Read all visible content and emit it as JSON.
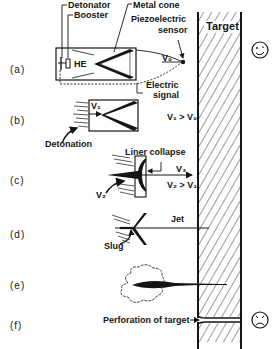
{
  "figure": {
    "colors": {
      "ink": "#151515",
      "background": "#ffffff"
    },
    "target_label": "Target",
    "stages": [
      {
        "id": "a",
        "label": "(a)"
      },
      {
        "id": "b",
        "label": "(b)"
      },
      {
        "id": "c",
        "label": "(c)"
      },
      {
        "id": "d",
        "label": "(d)"
      },
      {
        "id": "e",
        "label": "(e)"
      },
      {
        "id": "f",
        "label": "(f)"
      }
    ],
    "annotations": {
      "detonator": "Detonator",
      "booster": "Booster",
      "he": "HE",
      "metal_cone": "Metal cone",
      "piezo_1": "Piezoelectric",
      "piezo_2": "sensor",
      "v0": "V₀",
      "electric_1": "Electric",
      "electric_2": "signal",
      "v1": "V₁",
      "v1_gt_v0": "V₁ > V₀",
      "detonation": "Detonation",
      "liner_collapse": "Liner collapse",
      "v3": "V₃",
      "v2": "V₂",
      "v2_gt_v1": "V₂ > V₁",
      "jet": "Jet",
      "slug": "Slug",
      "perforation": "Perforation of target"
    },
    "icons": {
      "happy_face": "smiley-face-icon",
      "sad_face": "frowning-face-icon"
    }
  }
}
